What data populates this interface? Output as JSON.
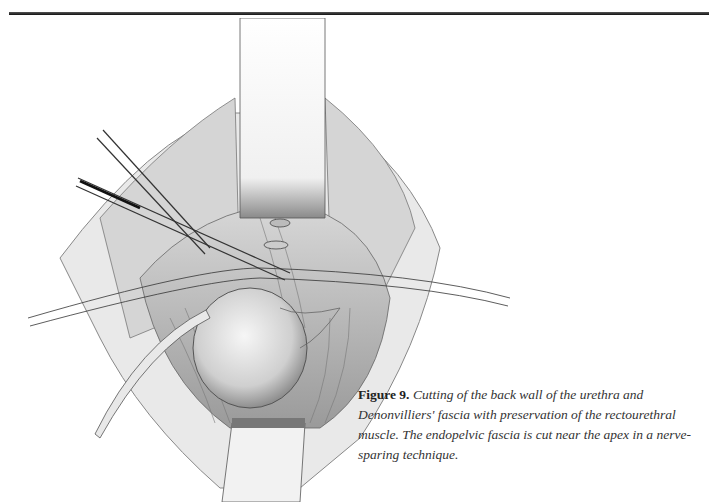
{
  "page": {
    "header_rule": true
  },
  "figure": {
    "label": "Figure 9.",
    "caption": "Cutting of the back wall of the urethra and Denonvilliers' fascia with preservation of the rectourethral muscle. The endopelvic fascia is cut near the apex in a nerve-sparing technique.",
    "illustration_description": "Surgical illustration: retractors holding open a pelvic incision, scissors cutting the urethra behind the pubis, sutures, a catheter, and the prostate/bladder exposed"
  }
}
